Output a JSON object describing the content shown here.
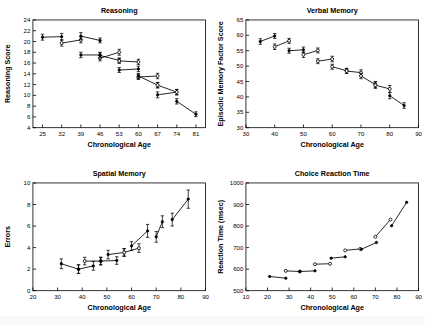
{
  "figure": {
    "background_color": "#ffffff",
    "ink_color": "#000000",
    "panel_count": 4
  },
  "chart_data": [
    {
      "type": "line",
      "panel": "top-left",
      "title": "Reasoning",
      "xlabel": "Chronological Age",
      "ylabel": "Reasoning Score",
      "xlim": [
        21.5,
        84.5
      ],
      "ylim": [
        4,
        24
      ],
      "xticks": [
        25,
        32,
        39,
        46,
        53,
        60,
        67,
        74,
        81
      ],
      "yticks": [
        4,
        6,
        8,
        10,
        12,
        14,
        16,
        18,
        20,
        22,
        24
      ],
      "grid": false,
      "legend": "none",
      "marker_style": "mixed-filled-and-open-circles-with-error-bars",
      "description": "Overlapping cohort segments declining with age",
      "series": [
        {
          "name": "cohort-1",
          "marker": "filled",
          "points": [
            {
              "x": 25,
              "y": 20.8,
              "err": 0.55
            },
            {
              "x": 32,
              "y": 20.9,
              "err": 0.6
            }
          ]
        },
        {
          "name": "cohort-2",
          "marker": "open",
          "points": [
            {
              "x": 32,
              "y": 19.7,
              "err": 0.55
            },
            {
              "x": 39,
              "y": 20.3,
              "err": 0.55
            }
          ]
        },
        {
          "name": "cohort-3",
          "marker": "filled",
          "points": [
            {
              "x": 39,
              "y": 21.0,
              "err": 0.65
            },
            {
              "x": 46,
              "y": 20.2,
              "err": 0.45
            }
          ]
        },
        {
          "name": "cohort-4",
          "marker": "filled",
          "points": [
            {
              "x": 39,
              "y": 17.5,
              "err": 0.5
            },
            {
              "x": 46,
              "y": 17.5,
              "err": 0.5
            }
          ]
        },
        {
          "name": "cohort-5",
          "marker": "open",
          "points": [
            {
              "x": 46,
              "y": 16.9,
              "err": 0.5
            },
            {
              "x": 53,
              "y": 18.0,
              "err": 0.55
            }
          ]
        },
        {
          "name": "cohort-6",
          "marker": "filled",
          "points": [
            {
              "x": 46,
              "y": 17.4,
              "err": 0.5
            },
            {
              "x": 53,
              "y": 16.5,
              "err": 0.45
            }
          ]
        },
        {
          "name": "cohort-7",
          "marker": "filled",
          "points": [
            {
              "x": 53,
              "y": 14.7,
              "err": 0.45
            },
            {
              "x": 60,
              "y": 14.9,
              "err": 0.5
            }
          ]
        },
        {
          "name": "cohort-8",
          "marker": "open",
          "points": [
            {
              "x": 53,
              "y": 16.4,
              "err": 0.45
            },
            {
              "x": 60,
              "y": 16.2,
              "err": 0.5
            }
          ]
        },
        {
          "name": "cohort-9",
          "marker": "open",
          "points": [
            {
              "x": 60,
              "y": 13.4,
              "err": 0.45
            },
            {
              "x": 67,
              "y": 13.6,
              "err": 0.5
            }
          ]
        },
        {
          "name": "cohort-10",
          "marker": "filled",
          "points": [
            {
              "x": 60,
              "y": 13.6,
              "err": 0.45
            },
            {
              "x": 67,
              "y": 11.9,
              "err": 0.5
            }
          ]
        },
        {
          "name": "cohort-11",
          "marker": "filled",
          "points": [
            {
              "x": 67,
              "y": 10.1,
              "err": 0.55
            },
            {
              "x": 74,
              "y": 10.6,
              "err": 0.5
            }
          ]
        },
        {
          "name": "cohort-12",
          "marker": "open",
          "points": [
            {
              "x": 67,
              "y": 11.9,
              "err": 0.5
            },
            {
              "x": 74,
              "y": 10.6,
              "err": 0.5
            }
          ]
        },
        {
          "name": "cohort-13",
          "marker": "filled",
          "points": [
            {
              "x": 74,
              "y": 8.9,
              "err": 0.5
            },
            {
              "x": 81,
              "y": 6.5,
              "err": 0.45
            }
          ]
        }
      ]
    },
    {
      "type": "line",
      "panel": "top-right",
      "title": "Verbal Memory",
      "xlabel": "Chronological Age",
      "ylabel": "Episodic Memory Factor Score",
      "xlim": [
        30,
        90
      ],
      "ylim": [
        30,
        65
      ],
      "xticks": [
        30,
        40,
        50,
        60,
        70,
        80,
        90
      ],
      "yticks": [
        30,
        35,
        40,
        45,
        50,
        55,
        60,
        65
      ],
      "grid": false,
      "legend": "none",
      "marker_style": "mixed-filled-and-open-circles-with-error-bars",
      "description": "Episodic memory declines steadily across cohorts",
      "series": [
        {
          "name": "cohort-1",
          "marker": "filled",
          "points": [
            {
              "x": 35,
              "y": 58.0,
              "err": 0.9
            },
            {
              "x": 40,
              "y": 59.8,
              "err": 0.8
            }
          ]
        },
        {
          "name": "cohort-2",
          "marker": "open",
          "points": [
            {
              "x": 40,
              "y": 56.3,
              "err": 0.9
            },
            {
              "x": 45,
              "y": 58.2,
              "err": 0.8
            }
          ]
        },
        {
          "name": "cohort-3",
          "marker": "filled",
          "points": [
            {
              "x": 45,
              "y": 55.0,
              "err": 0.8
            },
            {
              "x": 50,
              "y": 55.3,
              "err": 0.9
            }
          ]
        },
        {
          "name": "cohort-4",
          "marker": "open",
          "points": [
            {
              "x": 50,
              "y": 53.7,
              "err": 0.9
            },
            {
              "x": 55,
              "y": 55.1,
              "err": 0.8
            }
          ]
        },
        {
          "name": "cohort-5",
          "marker": "open",
          "points": [
            {
              "x": 55,
              "y": 51.6,
              "err": 0.8
            },
            {
              "x": 60,
              "y": 52.3,
              "err": 0.9
            }
          ]
        },
        {
          "name": "cohort-6",
          "marker": "open",
          "points": [
            {
              "x": 60,
              "y": 49.8,
              "err": 0.8
            },
            {
              "x": 65,
              "y": 48.5,
              "err": 0.8
            }
          ]
        },
        {
          "name": "cohort-7",
          "marker": "open",
          "points": [
            {
              "x": 65,
              "y": 48.4,
              "err": 0.8
            },
            {
              "x": 70,
              "y": 47.9,
              "err": 0.9
            }
          ]
        },
        {
          "name": "cohort-8",
          "marker": "open",
          "points": [
            {
              "x": 70,
              "y": 46.8,
              "err": 0.9
            },
            {
              "x": 75,
              "y": 44.0,
              "err": 1.0
            }
          ]
        },
        {
          "name": "cohort-9",
          "marker": "open",
          "points": [
            {
              "x": 75,
              "y": 43.8,
              "err": 1.0
            },
            {
              "x": 80,
              "y": 42.6,
              "err": 1.1
            }
          ]
        },
        {
          "name": "cohort-10",
          "marker": "filled",
          "points": [
            {
              "x": 80,
              "y": 40.4,
              "err": 1.0
            },
            {
              "x": 85,
              "y": 37.2,
              "err": 0.9
            }
          ]
        }
      ]
    },
    {
      "type": "line",
      "panel": "bottom-left",
      "title": "Spatial Memory",
      "xlabel": "Chronological Age",
      "ylabel": "Errors",
      "xlim": [
        20,
        90
      ],
      "ylim": [
        0,
        10
      ],
      "xticks": [
        20,
        30,
        40,
        50,
        60,
        70,
        80,
        90
      ],
      "yticks": [
        0,
        2,
        4,
        6,
        8,
        10
      ],
      "grid": false,
      "legend": "none",
      "marker_style": "filled-circles-with-error-bars",
      "description": "Spatial memory errors increase with age, accelerating after 60",
      "series": [
        {
          "name": "cohort-1",
          "marker": "filled",
          "points": [
            {
              "x": 31.5,
              "y": 2.5,
              "err": 0.45
            },
            {
              "x": 38.5,
              "y": 2.0,
              "err": 0.4
            }
          ]
        },
        {
          "name": "cohort-2",
          "marker": "filled",
          "points": [
            {
              "x": 38.5,
              "y": 2.0,
              "err": 0.4
            },
            {
              "x": 44.5,
              "y": 2.3,
              "err": 0.4
            }
          ]
        },
        {
          "name": "cohort-3",
          "marker": "open",
          "points": [
            {
              "x": 41.0,
              "y": 2.75,
              "err": 0.35
            },
            {
              "x": 47.5,
              "y": 2.75,
              "err": 0.35
            }
          ]
        },
        {
          "name": "cohort-4",
          "marker": "filled",
          "points": [
            {
              "x": 47.5,
              "y": 2.75,
              "err": 0.35
            },
            {
              "x": 54.0,
              "y": 2.8,
              "err": 0.35
            }
          ]
        },
        {
          "name": "cohort-5",
          "marker": "filled",
          "points": [
            {
              "x": 50.5,
              "y": 3.35,
              "err": 0.4
            },
            {
              "x": 57.0,
              "y": 3.55,
              "err": 0.35
            }
          ]
        },
        {
          "name": "cohort-6",
          "marker": "open",
          "points": [
            {
              "x": 57.0,
              "y": 3.55,
              "err": 0.35
            },
            {
              "x": 63.0,
              "y": 3.95,
              "err": 0.4
            }
          ]
        },
        {
          "name": "cohort-7",
          "marker": "filled",
          "points": [
            {
              "x": 60.0,
              "y": 4.15,
              "err": 0.4
            },
            {
              "x": 66.5,
              "y": 5.55,
              "err": 0.6
            }
          ]
        },
        {
          "name": "cohort-8",
          "marker": "filled",
          "points": [
            {
              "x": 70.0,
              "y": 5.0,
              "err": 0.5
            },
            {
              "x": 72.5,
              "y": 6.4,
              "err": 0.55
            }
          ]
        },
        {
          "name": "cohort-9",
          "marker": "filled",
          "points": [
            {
              "x": 76.5,
              "y": 6.6,
              "err": 0.6
            },
            {
              "x": 83.0,
              "y": 8.5,
              "err": 0.85
            }
          ]
        }
      ]
    },
    {
      "type": "line",
      "panel": "bottom-right",
      "title": "Choice Reaction Time",
      "xlabel": "Chronological Age",
      "ylabel": "Reaction Time (msec)",
      "xlim": [
        10,
        90
      ],
      "ylim": [
        500,
        1000
      ],
      "xticks": [
        10,
        20,
        30,
        40,
        50,
        60,
        70,
        80,
        90
      ],
      "yticks": [
        500,
        600,
        700,
        800,
        900,
        1000
      ],
      "grid": false,
      "legend": "none",
      "marker_style": "mixed-filled-and-open-circles",
      "description": "Reaction time slows with age, rising sharply after 70",
      "series": [
        {
          "name": "cohort-1",
          "marker": "filled",
          "points": [
            {
              "x": 21.0,
              "y": 566
            },
            {
              "x": 28.5,
              "y": 558
            }
          ]
        },
        {
          "name": "cohort-2",
          "marker": "open",
          "points": [
            {
              "x": 28.5,
              "y": 592
            },
            {
              "x": 35.0,
              "y": 589
            }
          ]
        },
        {
          "name": "cohort-3",
          "marker": "filled",
          "points": [
            {
              "x": 35.0,
              "y": 589
            },
            {
              "x": 42.0,
              "y": 592
            }
          ]
        },
        {
          "name": "cohort-4",
          "marker": "open",
          "points": [
            {
              "x": 42.0,
              "y": 623
            },
            {
              "x": 49.0,
              "y": 625
            }
          ]
        },
        {
          "name": "cohort-5",
          "marker": "filled",
          "points": [
            {
              "x": 49.5,
              "y": 651
            },
            {
              "x": 56.0,
              "y": 657
            }
          ]
        },
        {
          "name": "cohort-6",
          "marker": "open",
          "points": [
            {
              "x": 56.0,
              "y": 687
            },
            {
              "x": 63.0,
              "y": 694
            }
          ]
        },
        {
          "name": "cohort-7",
          "marker": "filled",
          "points": [
            {
              "x": 63.5,
              "y": 692
            },
            {
              "x": 70.5,
              "y": 724
            }
          ]
        },
        {
          "name": "cohort-8",
          "marker": "open",
          "points": [
            {
              "x": 70.0,
              "y": 750
            },
            {
              "x": 77.0,
              "y": 830
            }
          ]
        },
        {
          "name": "cohort-9",
          "marker": "filled",
          "points": [
            {
              "x": 77.5,
              "y": 801
            },
            {
              "x": 84.5,
              "y": 910
            }
          ]
        }
      ]
    }
  ]
}
